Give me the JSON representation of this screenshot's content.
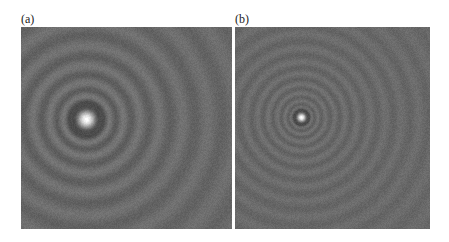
{
  "figure": {
    "panels": [
      {
        "label": "(a)",
        "description": "Diffraction pattern with bright central spot and concentric rings",
        "center_spot": "large",
        "ring_spacing": "wide"
      },
      {
        "label": "(b)",
        "description": "Diffraction pattern with smaller bright central spot and finer concentric rings",
        "center_spot": "small",
        "ring_spacing": "fine"
      }
    ]
  }
}
